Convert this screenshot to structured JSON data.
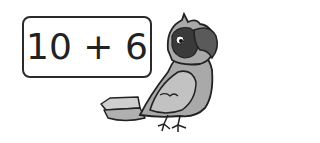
{
  "expression": {
    "text": "10 + 6",
    "left": 10,
    "operator": "+",
    "right": 6
  },
  "illustration": {
    "subject": "parrot",
    "style": "grayscale cartoon"
  },
  "colors": {
    "border": "#2a2a2a",
    "text": "#222222",
    "parrot_body": "#a8a8a8",
    "parrot_face": "#3a3a3a",
    "parrot_beak": "#555555",
    "background": "#ffffff"
  }
}
